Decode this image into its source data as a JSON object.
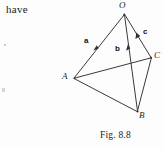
{
  "page": {
    "background_color": "#fdfdfd",
    "ink_color": "#2b2b2b",
    "body_text": "have",
    "caption": "Fig. 8.8"
  },
  "figure": {
    "name": "tetrahedron-vector-diagram",
    "vertices": [
      {
        "id": "O",
        "label": "O",
        "x": 124,
        "y": 14,
        "label_x": 119,
        "label_y": 1
      },
      {
        "id": "A",
        "label": "A",
        "x": 74,
        "y": 78,
        "label_x": 62,
        "label_y": 72
      },
      {
        "id": "B",
        "label": "B",
        "x": 138,
        "y": 112,
        "label_x": 139,
        "label_y": 110
      },
      {
        "id": "C",
        "label": "C",
        "x": 151,
        "y": 58,
        "label_x": 154,
        "label_y": 51
      }
    ],
    "edges": [
      {
        "from": "O",
        "to": "A",
        "name": "edge-OA"
      },
      {
        "from": "O",
        "to": "B",
        "name": "edge-OB"
      },
      {
        "from": "O",
        "to": "C",
        "name": "edge-OC"
      },
      {
        "from": "A",
        "to": "B",
        "name": "edge-AB"
      },
      {
        "from": "A",
        "to": "C",
        "name": "edge-AC"
      },
      {
        "from": "B",
        "to": "C",
        "name": "edge-BC"
      }
    ],
    "vectors": [
      {
        "id": "a",
        "label": "a",
        "along": "OA",
        "label_x": 84,
        "label_y": 37,
        "arrow_x": 96,
        "arrow_y": 47
      },
      {
        "id": "b",
        "label": "b",
        "along": "OB",
        "label_x": 115,
        "label_y": 45,
        "arrow_x": 128,
        "arrow_y": 48
      },
      {
        "id": "c",
        "label": "c",
        "along": "OC",
        "label_x": 143,
        "label_y": 28,
        "arrow_x": 137,
        "arrow_y": 35
      }
    ],
    "line_color": "#3a3a3a",
    "line_width": 1
  }
}
